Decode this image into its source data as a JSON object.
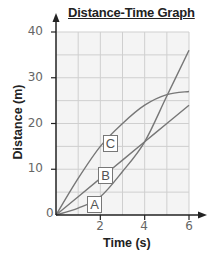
{
  "chart_data": {
    "type": "line",
    "title": "Distance-Time Graph",
    "xlabel": "Time (s)",
    "ylabel": "Distance (m)",
    "xlim": [
      0,
      6
    ],
    "ylim": [
      0,
      40
    ],
    "x_ticks": [
      "2",
      "4",
      "6"
    ],
    "y_ticks": [
      "0",
      "10",
      "20",
      "30",
      "40"
    ],
    "grid": true,
    "grid_x_step": 1,
    "grid_y_step": 5,
    "legend": "inline boxed labels",
    "series": [
      {
        "name": "A",
        "x": [
          0,
          1,
          2,
          3,
          4,
          5,
          6
        ],
        "values": [
          0,
          1.5,
          4,
          9.5,
          16,
          26,
          36
        ]
      },
      {
        "name": "B",
        "x": [
          0,
          1,
          2,
          3,
          4,
          5,
          6
        ],
        "values": [
          0,
          4,
          8,
          12,
          16,
          20,
          24
        ]
      },
      {
        "name": "C",
        "x": [
          0,
          1,
          2,
          3,
          4,
          5,
          6
        ],
        "values": [
          0,
          8,
          15,
          20,
          24,
          26.3,
          27
        ]
      }
    ]
  },
  "labels": {
    "title": "Distance-Time Graph",
    "xlabel": "Time (s)",
    "ylabel": "Distance (m)",
    "origin": "0",
    "y10": "10",
    "y20": "20",
    "y30": "30",
    "y40": "40",
    "x2": "2",
    "x4": "4",
    "x6": "6",
    "series_a": "A",
    "series_b": "B",
    "series_c": "C"
  },
  "colors": {
    "grid": "#cfcfcf",
    "plot_bg": "#f4f4f4",
    "axis": "#222222",
    "line": "#777777"
  }
}
